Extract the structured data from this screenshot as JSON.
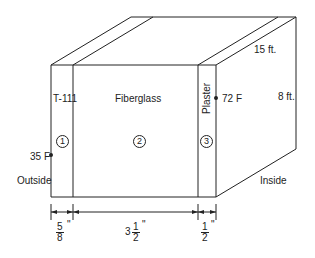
{
  "diagram": {
    "type": "wall cross-section (isometric box)",
    "layers": [
      {
        "number": "1",
        "label": "T-111",
        "thickness_whole": "",
        "thickness_num": "5",
        "thickness_den": "8",
        "unit": "\""
      },
      {
        "number": "2",
        "label": "Fiberglass",
        "thickness_whole": "3",
        "thickness_num": "1",
        "thickness_den": "2",
        "unit": "\""
      },
      {
        "number": "3",
        "label": "Plaster",
        "thickness_whole": "",
        "thickness_num": "1",
        "thickness_den": "2",
        "unit": "\""
      }
    ],
    "temperatures": {
      "outside": "35 F",
      "inside": "72 F"
    },
    "sides": {
      "outside": "Outside",
      "inside": "Inside"
    },
    "dimensions": {
      "length": "15 ft.",
      "height": "8 ft."
    }
  }
}
